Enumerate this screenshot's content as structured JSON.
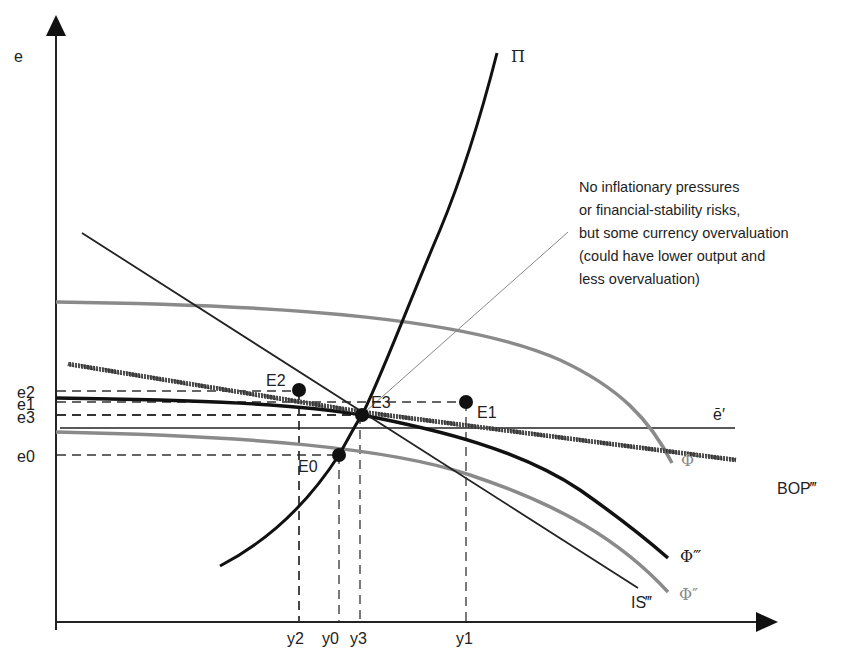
{
  "axes": {
    "y_label": "e",
    "x_ticks": [
      {
        "label": "y2",
        "x": 299
      },
      {
        "label": "y0",
        "x": 338
      },
      {
        "label": "y3",
        "x": 360
      },
      {
        "label": "y1",
        "x": 466
      }
    ],
    "y_ticks": [
      {
        "label": "e2",
        "y": 391
      },
      {
        "label": "e1",
        "y": 402
      },
      {
        "label": "e3",
        "y": 415
      },
      {
        "label": "e0",
        "y": 455
      }
    ]
  },
  "curves": {
    "pi": "Π",
    "phi1": "Φ′",
    "phi2": "Φ″",
    "phi3": "Φ‴",
    "is3": "IS‴",
    "bop3": "BOP‴",
    "ebar": "ē′"
  },
  "points": [
    {
      "label": "E0",
      "x": 339,
      "y": 455
    },
    {
      "label": "E1",
      "x": 466,
      "y": 402
    },
    {
      "label": "E2",
      "x": 299,
      "y": 390
    },
    {
      "label": "E3",
      "x": 362,
      "y": 415
    }
  ],
  "annotation": {
    "lines": [
      "No inflationary pressures",
      "or financial-stability risks,",
      "but some currency overvaluation",
      "(could have lower output and",
      "less overvaluation)"
    ]
  },
  "colors": {
    "black": "#111111",
    "grey": "#8a8a8a"
  }
}
